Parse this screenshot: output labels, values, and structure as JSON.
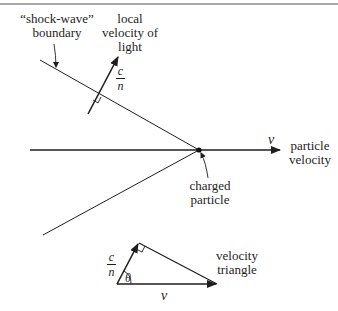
{
  "diagram": {
    "type": "cherenkov-radiation-geometry",
    "labels": {
      "shock_wave_line1": "“shock-wave”",
      "shock_wave_line2": "boundary",
      "local_velocity_line1": "local",
      "local_velocity_line2": "velocity of",
      "local_velocity_line3": "light",
      "c_over_n_numerator": "c",
      "c_over_n_denominator": "n",
      "v_symbol": "v",
      "particle_velocity_line1": "particle",
      "particle_velocity_line2": "velocity",
      "charged_particle_line1": "charged",
      "charged_particle_line2": "particle",
      "triangle_c_numerator": "c",
      "triangle_c_denominator": "n",
      "theta_symbol": "θ",
      "triangle_v_symbol": "v",
      "velocity_triangle_line1": "velocity",
      "velocity_triangle_line2": "triangle"
    },
    "colors": {
      "ink": "#1e1e1e",
      "background": "#ffffff",
      "border": "#888888"
    }
  }
}
